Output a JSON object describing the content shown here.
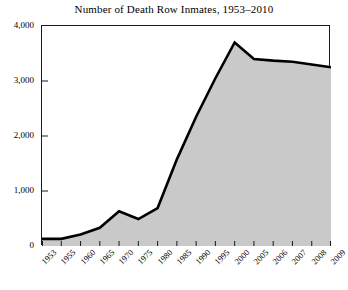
{
  "chart_data": {
    "type": "area",
    "title": "Number of Death Row Inmates, 1953–2010",
    "xlabel": "",
    "ylabel": "",
    "categories": [
      "1953",
      "1955",
      "1960",
      "1965",
      "1970",
      "1975",
      "1980",
      "1985",
      "1990",
      "1995",
      "2000",
      "2005",
      "2006",
      "2007",
      "2008",
      "2009"
    ],
    "values": [
      130,
      130,
      210,
      330,
      630,
      490,
      690,
      1575,
      2350,
      3050,
      3700,
      3400,
      3370,
      3350,
      3300,
      3250
    ],
    "series": [
      {
        "name": "Death row inmates",
        "values": [
          130,
          130,
          210,
          330,
          630,
          490,
          690,
          1575,
          2350,
          3050,
          3700,
          3400,
          3370,
          3350,
          3300,
          3250
        ]
      }
    ],
    "ylim": [
      0,
      4000
    ],
    "yticks": [
      0,
      1000,
      2000,
      3000,
      4000
    ],
    "ytick_labels": [
      "0",
      "1,000",
      "2,000",
      "3,000",
      "4,000"
    ],
    "grid": false,
    "legend": "none",
    "fill_color": "#c9c9c9",
    "line_color": "#000000",
    "frame_color": "#1a1a1a",
    "background_color": "#ffffff"
  }
}
